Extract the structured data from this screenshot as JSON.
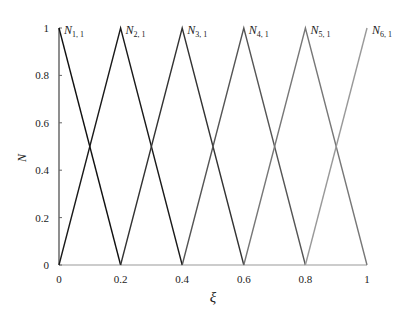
{
  "chart_data": {
    "type": "line",
    "title": "",
    "xlabel": "ξ",
    "ylabel": "N",
    "xlim": [
      0,
      1
    ],
    "ylim": [
      0,
      1
    ],
    "xticks": [
      "0",
      "0.2",
      "0.4",
      "0.6",
      "0.8",
      "1"
    ],
    "yticks": [
      "0",
      "0.2",
      "0.4",
      "0.6",
      "0.8",
      "1"
    ],
    "grid": false,
    "legend": "inline labels at peaks",
    "series": [
      {
        "name": "N1,1",
        "base": "N",
        "sub": "1, 1",
        "color": "#111111",
        "x": [
          0,
          0.2
        ],
        "y": [
          1,
          0
        ]
      },
      {
        "name": "N2,1",
        "base": "N",
        "sub": "2, 1",
        "color": "#1a1a1a",
        "x": [
          0,
          0.2,
          0.4
        ],
        "y": [
          0,
          1,
          0
        ]
      },
      {
        "name": "N3,1",
        "base": "N",
        "sub": "3, 1",
        "color": "#333333",
        "x": [
          0.2,
          0.4,
          0.6
        ],
        "y": [
          0,
          1,
          0
        ]
      },
      {
        "name": "N4,1",
        "base": "N",
        "sub": "4, 1",
        "color": "#555555",
        "x": [
          0.4,
          0.6,
          0.8
        ],
        "y": [
          0,
          1,
          0
        ]
      },
      {
        "name": "N5,1",
        "base": "N",
        "sub": "5, 1",
        "color": "#777777",
        "x": [
          0.6,
          0.8,
          1.0
        ],
        "y": [
          0,
          1,
          0
        ]
      },
      {
        "name": "N6,1",
        "base": "N",
        "sub": "6, 1",
        "color": "#999999",
        "x": [
          0.8,
          1.0
        ],
        "y": [
          0,
          1
        ]
      }
    ]
  }
}
